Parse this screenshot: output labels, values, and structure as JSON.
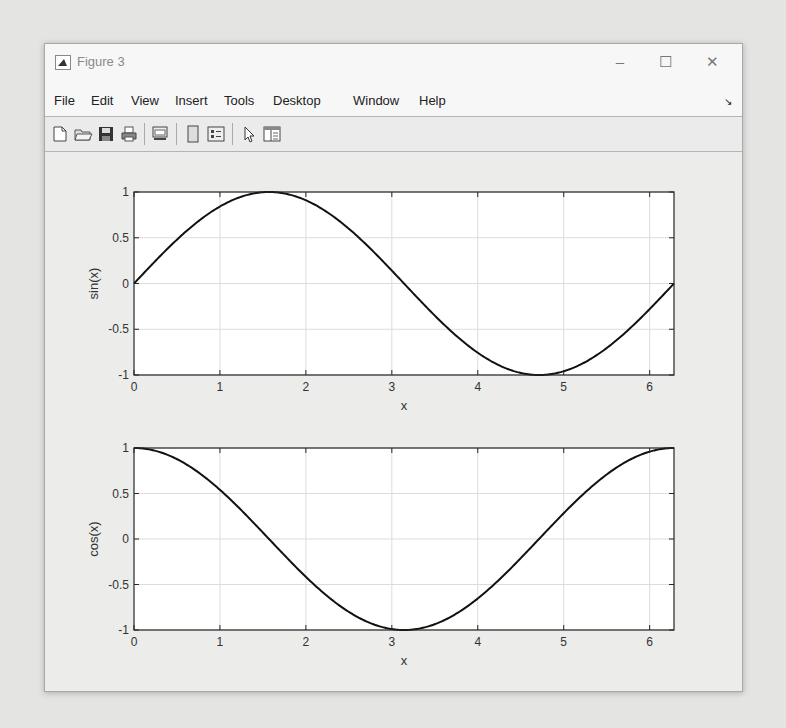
{
  "window": {
    "title": "Figure 3",
    "controls": {
      "minimize": "–",
      "maximize": "☐",
      "close": "✕"
    }
  },
  "menubar": {
    "items": [
      "File",
      "Edit",
      "View",
      "Insert",
      "Tools",
      "Desktop",
      "Window",
      "Help"
    ],
    "dock_icon": "dock-arrow-icon"
  },
  "toolbar": {
    "buttons": [
      "new-figure-icon",
      "open-file-icon",
      "save-icon",
      "print-icon",
      "link-plot-icon",
      "hide-plot-tools-icon",
      "show-plot-tools-icon",
      "edit-plot-pointer-icon",
      "property-editor-icon"
    ]
  },
  "colors": {
    "line": "#111111",
    "grid": "#dcdcdc",
    "axes_bg": "#ffffff",
    "figure_bg": "#ececea"
  },
  "chart_data": [
    {
      "type": "line",
      "title": "",
      "xlabel": "x",
      "ylabel": "sin(x)",
      "xlim": [
        0,
        6.2832
      ],
      "ylim": [
        -1,
        1
      ],
      "xticks": [
        0,
        1,
        2,
        3,
        4,
        5,
        6
      ],
      "yticks": [
        -1,
        -0.5,
        0,
        0.5,
        1
      ],
      "ytick_labels": [
        "-1",
        "-0.5",
        "0",
        "0.5",
        "1"
      ],
      "grid": true,
      "legend": null,
      "series": [
        {
          "name": "sin(x)",
          "function": "sin",
          "x": [
            0,
            0.5,
            1,
            1.5708,
            2,
            2.5,
            3,
            3.1416,
            3.5,
            4,
            4.5,
            4.7124,
            5,
            5.5,
            6,
            6.2832
          ],
          "y": [
            0,
            0.479,
            0.841,
            1,
            0.909,
            0.598,
            0.141,
            0,
            -0.351,
            -0.757,
            -0.978,
            -1,
            -0.959,
            -0.706,
            -0.279,
            0
          ]
        }
      ]
    },
    {
      "type": "line",
      "title": "",
      "xlabel": "x",
      "ylabel": "cos(x)",
      "xlim": [
        0,
        6.2832
      ],
      "ylim": [
        -1,
        1
      ],
      "xticks": [
        0,
        1,
        2,
        3,
        4,
        5,
        6
      ],
      "yticks": [
        -1,
        -0.5,
        0,
        0.5,
        1
      ],
      "ytick_labels": [
        "-1",
        "-0.5",
        "0",
        "0.5",
        "1"
      ],
      "grid": true,
      "legend": null,
      "series": [
        {
          "name": "cos(x)",
          "function": "cos",
          "x": [
            0,
            0.5,
            1,
            1.5708,
            2,
            2.5,
            3,
            3.1416,
            3.5,
            4,
            4.5,
            4.7124,
            5,
            5.5,
            6,
            6.2832
          ],
          "y": [
            1,
            0.878,
            0.54,
            0,
            -0.416,
            -0.801,
            -0.99,
            -1,
            -0.936,
            -0.654,
            -0.211,
            0,
            0.284,
            0.709,
            0.96,
            1
          ]
        }
      ]
    }
  ]
}
